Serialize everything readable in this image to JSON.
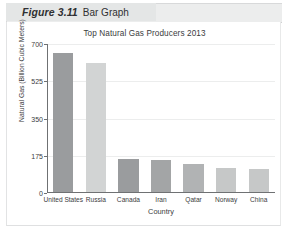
{
  "figure": {
    "number_label": "Figure 3.11",
    "caption": "Bar Graph"
  },
  "chart_data": {
    "type": "bar",
    "title": "Top Natural Gas Producers 2013",
    "xlabel": "Country",
    "ylabel": "Natural Gas (Billion Cubic Meters)",
    "categories": [
      "United States",
      "Russia",
      "Canada",
      "Iran",
      "Qatar",
      "Norway",
      "China"
    ],
    "values": [
      655,
      605,
      155,
      150,
      133,
      112,
      110
    ],
    "ylim": [
      0,
      700
    ],
    "yticks": [
      0,
      175,
      350,
      525,
      700
    ],
    "ytick_labels": [
      "0",
      "175",
      "350",
      "525",
      "700"
    ],
    "grid": true,
    "legend": "none",
    "bar_colors": [
      "#9a9c9e",
      "#d2d4d4",
      "#9a9c9e",
      "#a3a5a6",
      "#b1b3b4",
      "#c6c8c8",
      "#c6c8c8"
    ]
  },
  "colors": {
    "axis": "#6f7173",
    "gridline": "#eceded",
    "header_band": "#eceded",
    "plot_background": "#ffffff",
    "text": "#3b3c3e"
  }
}
